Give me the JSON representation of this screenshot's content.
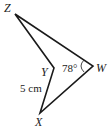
{
  "diagram": {
    "type": "geometry-quadrilateral",
    "vertices": {
      "Z": {
        "label": "Z",
        "x": 15,
        "y": 14
      },
      "W": {
        "label": "W",
        "x": 93,
        "y": 66
      },
      "X": {
        "label": "X",
        "x": 40,
        "y": 113
      },
      "Y": {
        "label": "Y",
        "x": 54,
        "y": 68
      }
    },
    "angle_W": "78°",
    "side_XY": "5 cm",
    "colors": {
      "line": "#1a1a1a",
      "text": "#222222"
    }
  }
}
